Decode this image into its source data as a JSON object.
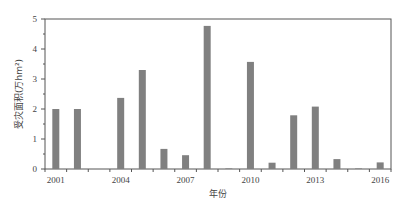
{
  "chart_data": {
    "type": "bar",
    "title": "",
    "xlabel": "年份",
    "ylabel": "受灾面积(万hm²)",
    "ylim": [
      0,
      5
    ],
    "yticks": [
      0,
      1,
      2,
      3,
      4,
      5
    ],
    "categories": [
      "2001",
      "2002",
      "2003",
      "2004",
      "2005",
      "2006",
      "2007",
      "2008",
      "2009",
      "2010",
      "2011",
      "2012",
      "2013",
      "2014",
      "2015",
      "2016"
    ],
    "xtick_labels": [
      "2001",
      "2004",
      "2007",
      "2010",
      "2013",
      "2016"
    ],
    "values": [
      2.0,
      2.0,
      0.0,
      2.37,
      3.3,
      0.67,
      0.46,
      4.77,
      0.02,
      3.57,
      0.21,
      1.79,
      2.08,
      0.33,
      0.02,
      0.22
    ],
    "grid": false,
    "legend": null,
    "bar_color": "#808080"
  }
}
